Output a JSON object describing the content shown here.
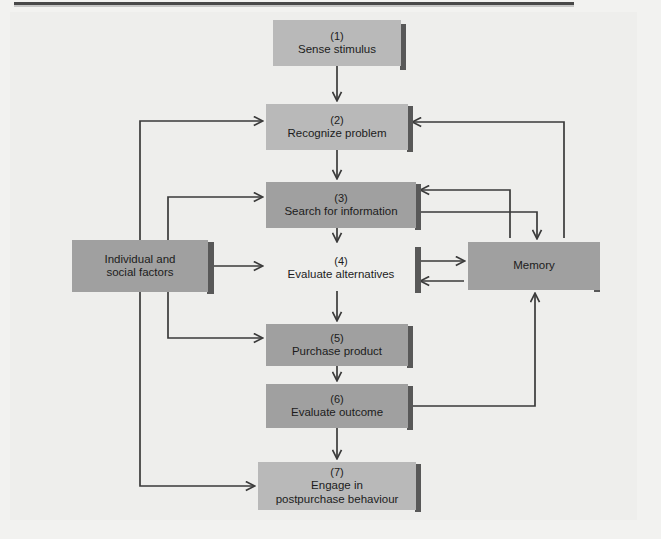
{
  "diagram": {
    "colors": {
      "page_background": "#f2f2f0",
      "canvas_background": "#eeeeec",
      "box_light": "#b9b9b9",
      "box_mid": "#a0a0a0",
      "box_shadow": "#585858",
      "line": "#3a3a3a",
      "text": "#1c1c1c"
    },
    "nodes": [
      {
        "id": "n1",
        "num": "(1)",
        "label": "Sense stimulus",
        "fill": "light",
        "x": 273,
        "y": 20,
        "w": 128,
        "h": 46
      },
      {
        "id": "n2",
        "num": "(2)",
        "label": "Recognize problem",
        "fill": "light",
        "x": 266,
        "y": 104,
        "w": 142,
        "h": 46
      },
      {
        "id": "n3",
        "num": "(3)",
        "label": "Search for information",
        "fill": "mid",
        "x": 266,
        "y": 182,
        "w": 150,
        "h": 46
      },
      {
        "id": "n4",
        "num": "(4)",
        "label": "Evaluate alternatives",
        "fill": "none",
        "x": 266,
        "y": 245,
        "w": 150,
        "h": 46
      },
      {
        "id": "n5",
        "num": "(5)",
        "label": "Purchase product",
        "fill": "mid",
        "x": 266,
        "y": 324,
        "w": 142,
        "h": 42
      },
      {
        "id": "n6",
        "num": "(6)",
        "label": "Evaluate outcome",
        "fill": "mid",
        "x": 266,
        "y": 384,
        "w": 142,
        "h": 44
      },
      {
        "id": "n7",
        "num": "(7)",
        "label": "Engage in\npostpurchase behaviour",
        "fill": "light",
        "x": 258,
        "y": 462,
        "w": 158,
        "h": 48
      },
      {
        "id": "nleft",
        "num": "",
        "label": "Individual and\nsocial factors",
        "fill": "mid",
        "x": 72,
        "y": 240,
        "w": 136,
        "h": 52
      },
      {
        "id": "nright",
        "num": "",
        "label": "Memory",
        "fill": "mid",
        "x": 468,
        "y": 242,
        "w": 132,
        "h": 48
      }
    ],
    "node_labels": {
      "n1_num": "(1)",
      "n1_label": "Sense stimulus",
      "n2_num": "(2)",
      "n2_label": "Recognize problem",
      "n3_num": "(3)",
      "n3_label": "Search for information",
      "n4_num": "(4)",
      "n4_label": "Evaluate alternatives",
      "n5_num": "(5)",
      "n5_label": "Purchase product",
      "n6_num": "(6)",
      "n6_label": "Evaluate outcome",
      "n7_num": "(7)",
      "n7_label_line1": "Engage in",
      "n7_label_line2": "postpurchase behaviour",
      "left_line1": "Individual and",
      "left_line2": "social factors",
      "right_label": "Memory"
    },
    "edges": [
      {
        "from": "n1",
        "to": "n2",
        "kind": "vertical-down"
      },
      {
        "from": "n2",
        "to": "n3",
        "kind": "vertical-down"
      },
      {
        "from": "n3",
        "to": "n4",
        "kind": "vertical-down"
      },
      {
        "from": "n4",
        "to": "n5",
        "kind": "vertical-down"
      },
      {
        "from": "n5",
        "to": "n6",
        "kind": "vertical-down"
      },
      {
        "from": "n6",
        "to": "n7",
        "kind": "vertical-down"
      },
      {
        "from": "nleft",
        "to": "n2",
        "kind": "left-routed"
      },
      {
        "from": "nleft",
        "to": "n3",
        "kind": "left-routed"
      },
      {
        "from": "nleft",
        "to": "n4",
        "kind": "direct-right"
      },
      {
        "from": "nleft",
        "to": "n5",
        "kind": "left-routed"
      },
      {
        "from": "nleft",
        "to": "n7",
        "kind": "left-routed"
      },
      {
        "from": "n3",
        "to": "nright",
        "kind": "right-routed-down"
      },
      {
        "from": "nright",
        "to": "n3",
        "kind": "right-routed-left"
      },
      {
        "from": "n4",
        "to": "nright",
        "kind": "direct-right"
      },
      {
        "from": "nright",
        "to": "n4",
        "kind": "direct-left"
      },
      {
        "from": "n6",
        "to": "nright",
        "kind": "right-routed-up"
      },
      {
        "from": "nright",
        "to": "n2",
        "kind": "right-routed-far-left"
      }
    ]
  }
}
